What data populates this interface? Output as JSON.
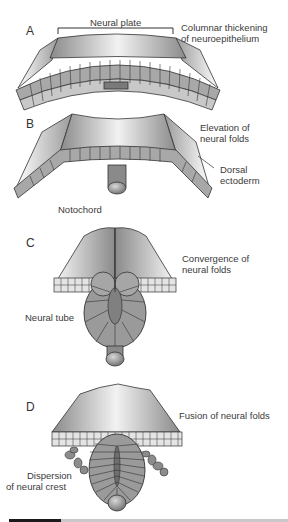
{
  "figure": {
    "panels": [
      {
        "letter": "A",
        "title_label": "Neural plate",
        "right_label_lines": [
          "Columnar thickening",
          "of neuroepithelium"
        ]
      },
      {
        "letter": "B",
        "right_label_lines": [
          "Elevation of",
          "neural folds"
        ],
        "side_label_lines": [
          "Dorsal",
          "ectoderm"
        ],
        "bottom_label": "Notochord"
      },
      {
        "letter": "C",
        "right_label_lines": [
          "Convergence of",
          "neural folds"
        ],
        "left_label": "Neural tube"
      },
      {
        "letter": "D",
        "right_label": "Fusion of neural folds",
        "left_label_lines": [
          "Dispersion",
          "of neural crest"
        ]
      }
    ],
    "colors": {
      "surface_light": "#f0f0f0",
      "surface_dark": "#8c8c8c",
      "cell_fill": "#9a9a9a",
      "cell_light": "#dcdcdc",
      "outline": "#2a2a2a"
    }
  }
}
